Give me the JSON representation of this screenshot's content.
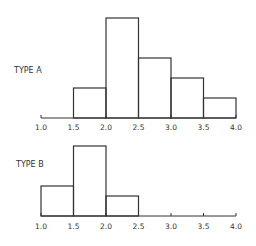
{
  "chart_data": [
    {
      "type": "bar",
      "title": "TYPE A",
      "xlabel": "",
      "ylabel": "",
      "bin_edges": [
        1.0,
        1.5,
        2.0,
        2.5,
        3.0,
        3.5,
        4.0
      ],
      "categories": [
        "1.0-1.5",
        "1.5-2.0",
        "2.0-2.5",
        "2.5-3.0",
        "3.0-3.5",
        "3.5-4.0"
      ],
      "values": [
        0,
        3,
        10,
        6,
        4,
        2
      ],
      "xticks": [
        "1.0",
        "1.5",
        "2.0",
        "2.5",
        "3.0",
        "3.5",
        "4.0"
      ],
      "xlim": [
        1.0,
        4.0
      ],
      "ylim": [
        0,
        10
      ],
      "grid": false,
      "legend": "none"
    },
    {
      "type": "bar",
      "title": "TYPE B",
      "xlabel": "",
      "ylabel": "",
      "bin_edges": [
        1.0,
        1.5,
        2.0,
        2.5,
        3.0,
        3.5,
        4.0
      ],
      "categories": [
        "1.0-1.5",
        "1.5-2.0",
        "2.0-2.5",
        "2.5-3.0",
        "3.0-3.5",
        "3.5-4.0"
      ],
      "values": [
        3,
        7,
        2,
        0,
        0,
        0
      ],
      "xticks": [
        "1.0",
        "1.5",
        "2.0",
        "2.5",
        "3.0",
        "3.5",
        "4.0"
      ],
      "xlim": [
        1.0,
        4.0
      ],
      "ylim": [
        0,
        10
      ],
      "grid": false,
      "legend": "none"
    }
  ]
}
